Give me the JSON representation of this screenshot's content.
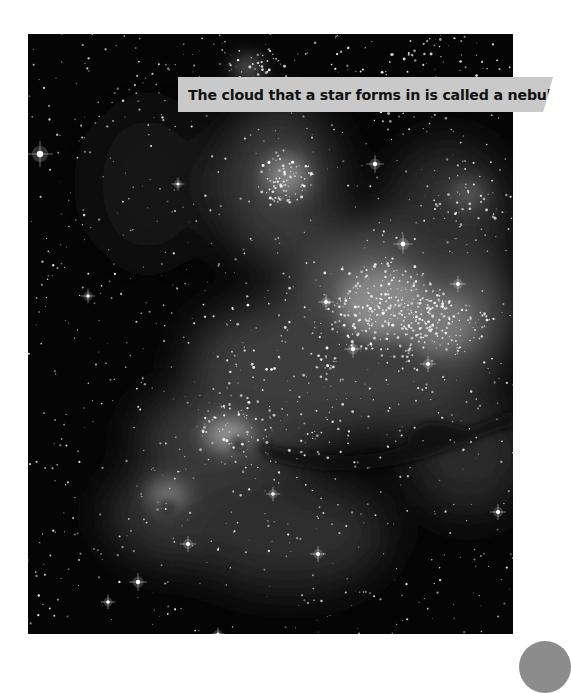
{
  "photo": {
    "subject": "star-forming nebula star field",
    "tone": "grayscale"
  },
  "caption": {
    "text": "The cloud that a star forms in is called a nebula."
  },
  "page_badge": {
    "color": "#8c8c8c"
  }
}
